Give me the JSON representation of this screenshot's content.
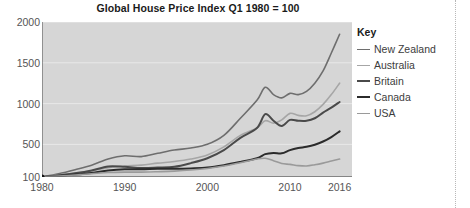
{
  "chart_data": {
    "type": "line",
    "title": "Global House Price Index Q1 1980 = 100",
    "xlabel": "",
    "ylabel": "",
    "xlim": [
      1980,
      2017.5
    ],
    "ylim": [
      100,
      2000
    ],
    "xticks": [
      1980,
      1990,
      2000,
      2010,
      2016
    ],
    "yticks": [
      100,
      500,
      1000,
      1500,
      2000
    ],
    "grid": true,
    "legend_position": "right",
    "legend_title": "Key",
    "x": [
      1980,
      1982,
      1984,
      1986,
      1988,
      1990,
      1992,
      1994,
      1996,
      1998,
      2000,
      2002,
      2004,
      2006,
      2007,
      2008,
      2009,
      2010,
      2011,
      2012,
      2013,
      2014,
      2015,
      2016
    ],
    "series": [
      {
        "name": "New Zealand",
        "color": "#6e6e6e",
        "width": 1.6,
        "values": [
          100,
          140,
          190,
          245,
          320,
          360,
          350,
          390,
          430,
          455,
          500,
          610,
          820,
          1040,
          1200,
          1110,
          1070,
          1125,
          1110,
          1150,
          1250,
          1400,
          1620,
          1850
        ]
      },
      {
        "name": "Australia",
        "color": "#a6a6a6",
        "width": 1.6,
        "values": [
          100,
          125,
          150,
          175,
          215,
          235,
          245,
          270,
          290,
          320,
          370,
          470,
          610,
          700,
          790,
          760,
          800,
          880,
          855,
          850,
          900,
          990,
          1110,
          1250
        ]
      },
      {
        "name": "Britain",
        "color": "#4a4a4a",
        "width": 2.0,
        "values": [
          100,
          120,
          145,
          180,
          230,
          225,
          210,
          215,
          225,
          270,
          330,
          430,
          580,
          700,
          870,
          790,
          725,
          800,
          790,
          790,
          820,
          890,
          950,
          1020
        ]
      },
      {
        "name": "Canada",
        "color": "#2b2b2b",
        "width": 2.0,
        "values": [
          100,
          115,
          130,
          150,
          180,
          195,
          195,
          200,
          200,
          205,
          215,
          245,
          285,
          330,
          380,
          395,
          390,
          430,
          455,
          470,
          495,
          535,
          590,
          660
        ]
      },
      {
        "name": "USA",
        "color": "#9a9a9a",
        "width": 1.6,
        "values": [
          100,
          112,
          125,
          140,
          155,
          160,
          160,
          165,
          172,
          185,
          205,
          235,
          275,
          320,
          330,
          300,
          265,
          255,
          240,
          235,
          250,
          270,
          295,
          320
        ]
      }
    ]
  },
  "legend": {
    "title": "Key",
    "items": [
      {
        "label": "New Zealand"
      },
      {
        "label": "Australia"
      },
      {
        "label": "Britain"
      },
      {
        "label": "Canada"
      },
      {
        "label": "USA"
      }
    ]
  },
  "axes": {
    "y_tick_labels": [
      "2000",
      "1500",
      "1000",
      "500",
      "100"
    ],
    "x_tick_labels": [
      "1980",
      "1990",
      "2000",
      "2010",
      "2016"
    ]
  },
  "colors": {
    "plot_background": "#d6d6d6",
    "gridline": "#e8e8e8",
    "axis": "#6b6b6b",
    "tick_text": "#555555",
    "title_text": "#1a1a1a"
  }
}
